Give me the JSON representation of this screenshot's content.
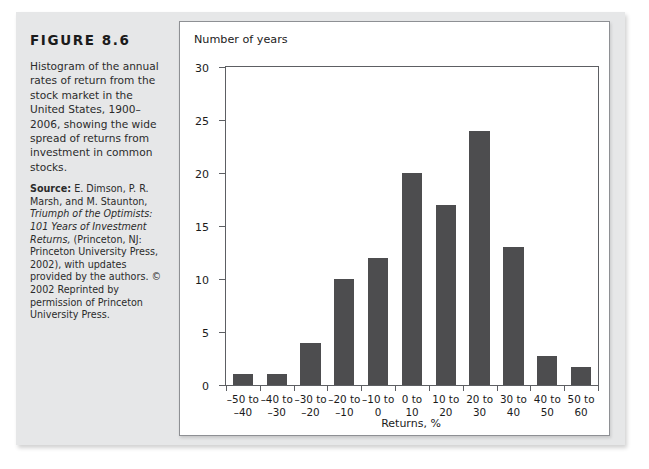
{
  "figure": {
    "label": "FIGURE 8.6",
    "caption": "Histogram of the annual rates of return from the stock market in the United States, 1900–2006, showing the wide spread of returns from investment in common stocks.",
    "source_lead": "Source:",
    "source_text": " E. Dimson, P. R. Marsh, and M. Staunton, ",
    "source_italic_1": "Triumph of the Optimists: 101 Years of Investment Returns,",
    "source_text_2": " (Princeton, NJ: Princeton University Press, 2002), with updates provided by the authors. © 2002 Reprinted by permission of Princeton University Press."
  },
  "colors": {
    "panel_background": "#e6e7e8",
    "chart_background": "#ffffff",
    "bar_fill": "#4d4d4f",
    "axis_line": "#5d5f63",
    "text": "#1b1b1b"
  },
  "chart_data": {
    "type": "bar",
    "title": "Number of years",
    "xlabel": "Returns, %",
    "ylabel": "Number of years",
    "categories": [
      "–50 to –40",
      "–40 to –30",
      "–30 to –20",
      "–20 to –10",
      "–10 to 0",
      "0 to 10",
      "10 to 20",
      "20 to 30",
      "30 to 40",
      "40 to 50",
      "50 to 60"
    ],
    "category_lines": [
      [
        "–50 to",
        "–40"
      ],
      [
        "–40 to",
        "–30"
      ],
      [
        "–30 to",
        "–20"
      ],
      [
        "–20 to",
        "–10"
      ],
      [
        "–10 to",
        "0"
      ],
      [
        "0 to",
        "10"
      ],
      [
        "10 to",
        "20"
      ],
      [
        "20 to",
        "30"
      ],
      [
        "30 to",
        "40"
      ],
      [
        "40 to",
        "50"
      ],
      [
        "50 to",
        "60"
      ]
    ],
    "values": [
      1,
      1,
      4,
      10,
      12,
      20,
      17,
      24,
      13,
      2.7,
      1.7
    ],
    "ylim": [
      0,
      30
    ],
    "yticks": [
      0,
      5,
      10,
      15,
      20,
      25,
      30
    ],
    "ytick_labels": [
      "0",
      "5",
      "10",
      "15",
      "20",
      "25",
      "30"
    ],
    "grid": false,
    "legend": false
  }
}
